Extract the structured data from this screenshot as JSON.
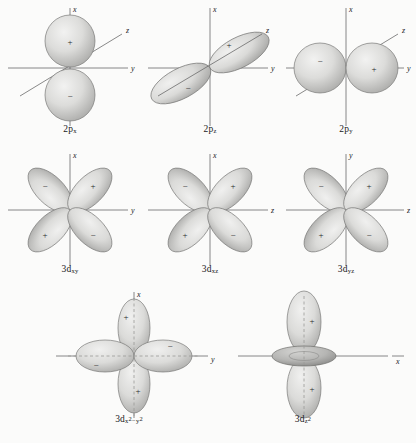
{
  "figure": {
    "background_color": "#fbfbfa",
    "lobe_fill_color": "#d8d8d6",
    "lobe_edge_color": "#6f6f6f",
    "axis_color": "#6b6b6b",
    "text_color": "#1a1a1a"
  },
  "orbitals": [
    {
      "id": "2px",
      "row": 1,
      "col": 1,
      "label_main": "2p",
      "label_sub": "x",
      "shape": "two-lobe",
      "lobe_form": "sphere",
      "orientation": "vertical",
      "axes": [
        {
          "name": "x",
          "label": "x",
          "direction": "up"
        },
        {
          "name": "y",
          "label": "y",
          "direction": "right"
        },
        {
          "name": "z",
          "label": "z",
          "direction": "diagonal-up-right"
        }
      ],
      "signs": [
        {
          "value": "+",
          "position": "top"
        },
        {
          "value": "−",
          "position": "bottom"
        }
      ],
      "dashed_axis": false
    },
    {
      "id": "2pz",
      "row": 1,
      "col": 2,
      "label_main": "2p",
      "label_sub": "z",
      "shape": "two-lobe",
      "lobe_form": "ellipse",
      "orientation": "diagonal",
      "axes": [
        {
          "name": "x",
          "label": "x",
          "direction": "up"
        },
        {
          "name": "y",
          "label": "y",
          "direction": "right"
        },
        {
          "name": "z",
          "label": "z",
          "direction": "diagonal-up-right"
        }
      ],
      "signs": [
        {
          "value": "+",
          "position": "upper-right"
        },
        {
          "value": "−",
          "position": "lower-left"
        }
      ],
      "dashed_axis": false
    },
    {
      "id": "2py",
      "row": 1,
      "col": 3,
      "label_main": "2p",
      "label_sub": "y",
      "shape": "two-lobe",
      "lobe_form": "sphere",
      "orientation": "horizontal",
      "axes": [
        {
          "name": "x",
          "label": "x",
          "direction": "up"
        },
        {
          "name": "y",
          "label": "y",
          "direction": "right"
        },
        {
          "name": "z",
          "label": "z",
          "direction": "diagonal-up-right"
        }
      ],
      "signs": [
        {
          "value": "−",
          "position": "left"
        },
        {
          "value": "+",
          "position": "right"
        }
      ],
      "dashed_axis": false
    },
    {
      "id": "3dxy",
      "row": 2,
      "col": 1,
      "label_main": "3d",
      "label_sub": "xy",
      "shape": "four-lobe",
      "lobe_form": "teardrop",
      "orientation": "between-axes",
      "axes": [
        {
          "name": "x",
          "label": "x",
          "direction": "up"
        },
        {
          "name": "y",
          "label": "y",
          "direction": "right"
        }
      ],
      "signs": [
        {
          "value": "−",
          "position": "upper-left"
        },
        {
          "value": "+",
          "position": "upper-right"
        },
        {
          "value": "+",
          "position": "lower-left"
        },
        {
          "value": "−",
          "position": "lower-right"
        }
      ],
      "dashed_axis": false
    },
    {
      "id": "3dxz",
      "row": 2,
      "col": 2,
      "label_main": "3d",
      "label_sub": "xz",
      "shape": "four-lobe",
      "lobe_form": "teardrop",
      "orientation": "between-axes",
      "axes": [
        {
          "name": "x",
          "label": "x",
          "direction": "up"
        },
        {
          "name": "z",
          "label": "z",
          "direction": "right"
        }
      ],
      "signs": [
        {
          "value": "−",
          "position": "upper-left"
        },
        {
          "value": "+",
          "position": "upper-right"
        },
        {
          "value": "+",
          "position": "lower-left"
        },
        {
          "value": "−",
          "position": "lower-right"
        }
      ],
      "dashed_axis": false
    },
    {
      "id": "3dyz",
      "row": 2,
      "col": 3,
      "label_main": "3d",
      "label_sub": "yz",
      "shape": "four-lobe",
      "lobe_form": "teardrop",
      "orientation": "between-axes",
      "axes": [
        {
          "name": "y",
          "label": "y",
          "direction": "up"
        },
        {
          "name": "z",
          "label": "z",
          "direction": "right"
        }
      ],
      "signs": [
        {
          "value": "−",
          "position": "upper-left"
        },
        {
          "value": "+",
          "position": "upper-right"
        },
        {
          "value": "+",
          "position": "lower-left"
        },
        {
          "value": "−",
          "position": "lower-right"
        }
      ],
      "dashed_axis": false
    },
    {
      "id": "3dx2-y2",
      "row": 3,
      "col": 1,
      "label_main": "3d",
      "label_sub_pre": "x",
      "label_sup_pre": "2",
      "label_sub_mid": "−",
      "label_sub_post": "y",
      "label_sup_post": "2",
      "shape": "four-lobe",
      "lobe_form": "teardrop",
      "orientation": "on-axes",
      "axes": [
        {
          "name": "x",
          "label": "x",
          "direction": "up"
        },
        {
          "name": "y",
          "label": "y",
          "direction": "right"
        }
      ],
      "signs": [
        {
          "value": "+",
          "position": "top"
        },
        {
          "value": "+",
          "position": "bottom"
        },
        {
          "value": "−",
          "position": "left"
        },
        {
          "value": "−",
          "position": "right"
        }
      ],
      "dashed_axis": true
    },
    {
      "id": "3dz2",
      "row": 3,
      "col": 2,
      "label_main": "3d",
      "label_sub": "z",
      "label_sup": "2",
      "shape": "two-lobe-torus",
      "lobe_form": "teardrop",
      "orientation": "vertical",
      "axes": [
        {
          "name": "z",
          "label": "z",
          "direction": "up"
        },
        {
          "name": "x",
          "label": "x",
          "direction": "right"
        }
      ],
      "signs": [
        {
          "value": "+",
          "position": "top"
        },
        {
          "value": "+",
          "position": "bottom"
        }
      ],
      "torus": true,
      "dashed_axis": true
    }
  ]
}
